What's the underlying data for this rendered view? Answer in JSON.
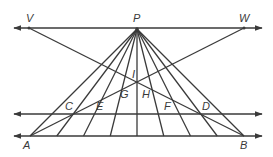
{
  "diagram": {
    "type": "geometry-figure",
    "stroke_color": "#3a3a3a",
    "background": "#ffffff",
    "lines": {
      "top_line": {
        "from": [
          14,
          28
        ],
        "to": [
          262,
          28
        ],
        "arrows": "both",
        "through": [
          "V",
          "P",
          "W"
        ]
      },
      "middle_line": {
        "from": [
          14,
          114
        ],
        "to": [
          262,
          114
        ],
        "arrows": "both",
        "through": [
          "C",
          "D"
        ]
      },
      "bottom_line": {
        "from": [
          14,
          136
        ],
        "to": [
          262,
          136
        ],
        "arrows": "both",
        "through": [
          "A",
          "B"
        ]
      },
      "segment_VB": {
        "from": "V",
        "to": "B"
      },
      "segment_WA": {
        "from": "W",
        "to": "A"
      }
    },
    "rays_from_P": {
      "apex": "P",
      "endpoints_x_on_bottom": [
        30,
        56.75,
        83.5,
        110.25,
        137,
        163.75,
        190.5,
        217.25,
        244
      ],
      "bottom_y": 136
    },
    "points": {
      "V": {
        "x": 29,
        "y": 28
      },
      "P": {
        "x": 137,
        "y": 29
      },
      "W": {
        "x": 244,
        "y": 28
      },
      "A": {
        "x": 30,
        "y": 136
      },
      "B": {
        "x": 244,
        "y": 136
      },
      "I": {
        "x": 137,
        "y": 82
      }
    },
    "labels": [
      {
        "text": "V",
        "x": 26,
        "y": 22
      },
      {
        "text": "P",
        "x": 133,
        "y": 22
      },
      {
        "text": "W",
        "x": 239,
        "y": 22
      },
      {
        "text": "I",
        "x": 132,
        "y": 78
      },
      {
        "text": "G",
        "x": 120,
        "y": 98
      },
      {
        "text": "H",
        "x": 142,
        "y": 98
      },
      {
        "text": "C",
        "x": 65,
        "y": 110
      },
      {
        "text": "E",
        "x": 96,
        "y": 110
      },
      {
        "text": "F",
        "x": 164,
        "y": 110
      },
      {
        "text": "D",
        "x": 202,
        "y": 110
      },
      {
        "text": "A",
        "x": 23,
        "y": 149
      },
      {
        "text": "B",
        "x": 240,
        "y": 149
      }
    ]
  }
}
